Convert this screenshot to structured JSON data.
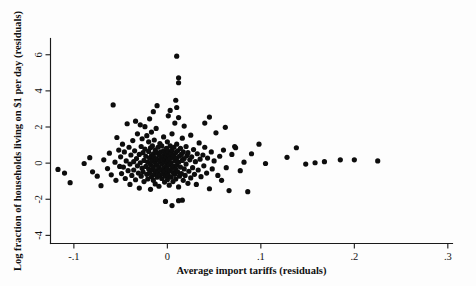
{
  "chart_data": {
    "type": "scatter",
    "title": "",
    "xlabel": "Average import tariffs (residuals)",
    "ylabel": "Log fraction of households living on $1 per day (residuals)",
    "xlim": [
      -0.125,
      0.305
    ],
    "ylim": [
      -4.45,
      6.9
    ],
    "xticks": [
      -0.1,
      0,
      0.1,
      0.2,
      0.3
    ],
    "xticklabels": [
      "-.1",
      "0",
      ".1",
      ".2",
      ".3"
    ],
    "yticks": [
      -4,
      -2,
      0,
      2,
      4,
      6
    ],
    "yticklabels": [
      "-4",
      "-2",
      "0",
      "2",
      "4",
      "6"
    ],
    "grid": false,
    "legend": null,
    "marker": "filled-circle",
    "marker_color": "#0d0d0d",
    "marker_size": 2.6,
    "n_points": 233,
    "points": [
      [
        -0.117,
        -0.35
      ],
      [
        -0.11,
        -0.55
      ],
      [
        -0.104,
        -1.08
      ],
      [
        -0.089,
        -0.02
      ],
      [
        -0.083,
        0.3
      ],
      [
        -0.08,
        -0.48
      ],
      [
        -0.075,
        -0.72
      ],
      [
        -0.071,
        -1.25
      ],
      [
        -0.068,
        0.18
      ],
      [
        -0.064,
        -0.3
      ],
      [
        -0.062,
        0.55
      ],
      [
        -0.06,
        -0.65
      ],
      [
        -0.058,
        3.22
      ],
      [
        -0.056,
        0.05
      ],
      [
        -0.055,
        -0.95
      ],
      [
        -0.054,
        1.42
      ],
      [
        -0.052,
        0.72
      ],
      [
        -0.051,
        -0.18
      ],
      [
        -0.05,
        0.35
      ],
      [
        -0.049,
        -0.58
      ],
      [
        -0.048,
        1.05
      ],
      [
        -0.047,
        -0.22
      ],
      [
        -0.046,
        0.62
      ],
      [
        -0.045,
        -0.85
      ],
      [
        -0.044,
        0.12
      ],
      [
        -0.043,
        2.18
      ],
      [
        -0.042,
        -0.42
      ],
      [
        -0.041,
        0.88
      ],
      [
        -0.04,
        -0.05
      ],
      [
        -0.04,
        -1.18
      ],
      [
        -0.039,
        0.45
      ],
      [
        -0.038,
        -0.68
      ],
      [
        -0.037,
        1.25
      ],
      [
        -0.036,
        0.08
      ],
      [
        -0.036,
        -0.38
      ],
      [
        -0.035,
        0.68
      ],
      [
        -0.034,
        -0.92
      ],
      [
        -0.034,
        2.32
      ],
      [
        -0.033,
        0.25
      ],
      [
        -0.032,
        -0.15
      ],
      [
        -0.032,
        1.62
      ],
      [
        -0.031,
        -0.55
      ],
      [
        -0.03,
        0.48
      ],
      [
        -0.03,
        -1.38
      ],
      [
        -0.029,
        0.02
      ],
      [
        -0.029,
        2.12
      ],
      [
        -0.028,
        -0.72
      ],
      [
        -0.028,
        0.92
      ],
      [
        -0.027,
        -0.28
      ],
      [
        -0.027,
        1.35
      ],
      [
        -0.026,
        0.58
      ],
      [
        -0.026,
        -0.48
      ],
      [
        -0.025,
        0.15
      ],
      [
        -0.025,
        -1.02
      ],
      [
        -0.024,
        0.78
      ],
      [
        -0.024,
        2.02
      ],
      [
        -0.023,
        -0.18
      ],
      [
        -0.023,
        0.38
      ],
      [
        -0.022,
        -0.62
      ],
      [
        -0.022,
        1.52
      ],
      [
        -0.021,
        0.05
      ],
      [
        -0.021,
        -0.88
      ],
      [
        -0.02,
        0.65
      ],
      [
        -0.02,
        -0.32
      ],
      [
        -0.02,
        1.18
      ],
      [
        -0.019,
        0.28
      ],
      [
        -0.019,
        -0.52
      ],
      [
        -0.019,
        2.45
      ],
      [
        -0.018,
        0.85
      ],
      [
        -0.018,
        -0.08
      ],
      [
        -0.018,
        -1.45
      ],
      [
        -0.017,
        0.42
      ],
      [
        -0.017,
        -0.75
      ],
      [
        -0.017,
        1.72
      ],
      [
        -0.016,
        0.12
      ],
      [
        -0.016,
        -0.38
      ],
      [
        -0.016,
        0.95
      ],
      [
        -0.015,
        -0.95
      ],
      [
        -0.015,
        0.52
      ],
      [
        -0.015,
        2.85
      ],
      [
        -0.015,
        -0.22
      ],
      [
        -0.014,
        0.32
      ],
      [
        -0.014,
        -0.62
      ],
      [
        -0.014,
        1.28
      ],
      [
        -0.013,
        0.02
      ],
      [
        -0.013,
        -1.15
      ],
      [
        -0.013,
        0.72
      ],
      [
        -0.012,
        -0.42
      ],
      [
        -0.012,
        0.22
      ],
      [
        -0.012,
        1.92
      ],
      [
        -0.011,
        -0.78
      ],
      [
        -0.011,
        0.58
      ],
      [
        -0.011,
        -0.12
      ],
      [
        -0.01,
        0.88
      ],
      [
        -0.01,
        -0.52
      ],
      [
        -0.01,
        0.18
      ],
      [
        -0.009,
        -1.28
      ],
      [
        -0.009,
        0.45
      ],
      [
        -0.009,
        -0.25
      ],
      [
        -0.008,
        1.08
      ],
      [
        -0.008,
        -0.68
      ],
      [
        -0.008,
        0.08
      ],
      [
        -0.007,
        0.62
      ],
      [
        -0.007,
        -0.38
      ],
      [
        -0.007,
        0.3
      ],
      [
        -0.006,
        -0.85
      ],
      [
        -0.006,
        0.95
      ],
      [
        -0.006,
        -0.05
      ],
      [
        -0.005,
        0.38
      ],
      [
        -0.005,
        -0.58
      ],
      [
        -0.005,
        0.15
      ],
      [
        -0.004,
        1.45
      ],
      [
        -0.004,
        -0.28
      ],
      [
        -0.004,
        0.68
      ],
      [
        -0.003,
        -1.05
      ],
      [
        -0.003,
        0.05
      ],
      [
        -0.003,
        -0.45
      ],
      [
        -0.002,
        0.52
      ],
      [
        -0.002,
        0.22
      ],
      [
        -0.002,
        -0.72
      ],
      [
        -0.001,
        0.82
      ],
      [
        -0.001,
        -0.15
      ],
      [
        -0.001,
        0.35
      ],
      [
        0.0,
        -0.55
      ],
      [
        0.0,
        0.08
      ],
      [
        0.0,
        1.18
      ],
      [
        0.0,
        -0.92
      ],
      [
        0.0,
        0.48
      ],
      [
        0.0,
        -0.32
      ],
      [
        0.001,
        0.65
      ],
      [
        0.001,
        0.18
      ],
      [
        0.001,
        -0.68
      ],
      [
        0.001,
        2.62
      ],
      [
        0.002,
        -0.08
      ],
      [
        0.002,
        0.42
      ],
      [
        0.002,
        -1.22
      ],
      [
        0.003,
        0.95
      ],
      [
        0.003,
        -0.42
      ],
      [
        0.003,
        0.25
      ],
      [
        0.004,
        -0.78
      ],
      [
        0.004,
        0.55
      ],
      [
        0.004,
        0.02
      ],
      [
        0.005,
        1.62
      ],
      [
        0.005,
        -0.25
      ],
      [
        0.005,
        0.72
      ],
      [
        0.006,
        -0.52
      ],
      [
        0.006,
        0.32
      ],
      [
        0.006,
        -1.02
      ],
      [
        0.007,
        0.88
      ],
      [
        0.007,
        -0.18
      ],
      [
        0.007,
        0.45
      ],
      [
        0.008,
        -0.62
      ],
      [
        0.008,
        0.12
      ],
      [
        0.008,
        2.22
      ],
      [
        0.009,
        -0.35
      ],
      [
        0.009,
        0.58
      ],
      [
        0.009,
        -0.88
      ],
      [
        0.01,
        0.28
      ],
      [
        0.01,
        -0.12
      ],
      [
        0.01,
        1.05
      ],
      [
        0.011,
        -0.48
      ],
      [
        0.011,
        0.68
      ],
      [
        0.012,
        0.05
      ],
      [
        0.012,
        -1.32
      ],
      [
        0.013,
        0.38
      ],
      [
        0.013,
        -0.72
      ],
      [
        0.014,
        0.82
      ],
      [
        0.014,
        -0.22
      ],
      [
        0.015,
        0.48
      ],
      [
        0.015,
        -0.58
      ],
      [
        0.016,
        0.15
      ],
      [
        0.016,
        1.38
      ],
      [
        0.017,
        -0.95
      ],
      [
        0.017,
        0.62
      ],
      [
        0.018,
        -0.32
      ],
      [
        0.018,
        0.25
      ],
      [
        0.019,
        -0.68
      ],
      [
        0.02,
        0.92
      ],
      [
        0.02,
        -0.05
      ],
      [
        0.021,
        0.42
      ],
      [
        0.022,
        -1.12
      ],
      [
        0.022,
        0.58
      ],
      [
        0.023,
        -0.45
      ],
      [
        0.024,
        0.18
      ],
      [
        0.025,
        -0.82
      ],
      [
        0.025,
        1.55
      ],
      [
        0.026,
        0.35
      ],
      [
        0.027,
        -0.25
      ],
      [
        0.028,
        0.75
      ],
      [
        0.029,
        -0.62
      ],
      [
        0.03,
        0.08
      ],
      [
        0.031,
        -1.18
      ],
      [
        0.032,
        0.52
      ],
      [
        0.033,
        -0.38
      ],
      [
        0.034,
        1.12
      ],
      [
        0.035,
        0.22
      ],
      [
        0.036,
        -0.75
      ],
      [
        0.038,
        0.45
      ],
      [
        0.039,
        -0.15
      ],
      [
        0.04,
        0.88
      ],
      [
        0.042,
        -0.55
      ],
      [
        0.043,
        0.28
      ],
      [
        0.045,
        -1.42
      ],
      [
        0.047,
        0.62
      ],
      [
        0.048,
        -0.32
      ],
      [
        0.05,
        0.12
      ],
      [
        0.052,
        1.68
      ],
      [
        0.054,
        -0.68
      ],
      [
        0.056,
        0.38
      ],
      [
        0.058,
        -0.95
      ],
      [
        0.06,
        0.72
      ],
      [
        0.063,
        -0.25
      ],
      [
        0.066,
        -1.52
      ],
      [
        0.069,
        0.48
      ],
      [
        0.072,
        0.92
      ],
      [
        0.073,
        0.85
      ],
      [
        0.078,
        -0.42
      ],
      [
        0.082,
        0.05
      ],
      [
        0.086,
        -1.58
      ],
      [
        0.09,
        0.52
      ],
      [
        0.01,
        5.92
      ],
      [
        0.012,
        4.72
      ],
      [
        0.012,
        4.45
      ],
      [
        0.009,
        3.48
      ],
      [
        0.01,
        3.08
      ],
      [
        0.012,
        2.52
      ],
      [
        0.045,
        2.55
      ],
      [
        0.018,
        2.05
      ],
      [
        -0.002,
        -2.12
      ],
      [
        0.005,
        -2.35
      ],
      [
        0.012,
        -2.08
      ],
      [
        0.016,
        -2.05
      ],
      [
        0.128,
        0.32
      ],
      [
        0.138,
        0.85
      ],
      [
        0.148,
        -0.05
      ],
      [
        0.158,
        0.02
      ],
      [
        0.168,
        0.08
      ],
      [
        0.185,
        0.18
      ],
      [
        0.2,
        0.18
      ],
      [
        0.225,
        0.12
      ],
      [
        0.105,
        -0.02
      ],
      [
        0.098,
        1.05
      ],
      [
        0.062,
        1.98
      ],
      [
        0.04,
        2.22
      ],
      [
        -0.011,
        3.18
      ],
      [
        0.003,
        2.92
      ]
    ]
  }
}
